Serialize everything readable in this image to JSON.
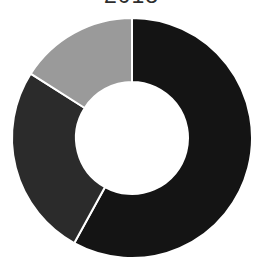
{
  "chart_data": {
    "type": "pie",
    "variant": "donut",
    "title": "2018",
    "categories": [
      "Segment A",
      "Segment B",
      "Segment C"
    ],
    "values": [
      58,
      26,
      16
    ],
    "unit": "%",
    "colors": [
      "#141414",
      "#2b2b2b",
      "#9a9a9a"
    ],
    "start_angle_deg": 0,
    "direction": "clockwise",
    "legend": "none",
    "data_labels": "none",
    "inner_radius_ratio": 0.47
  },
  "geometry": {
    "cx": 132,
    "cy": 138,
    "outer_r": 120,
    "inner_r": 56,
    "separator_color": "#ffffff",
    "separator_width": 2
  }
}
